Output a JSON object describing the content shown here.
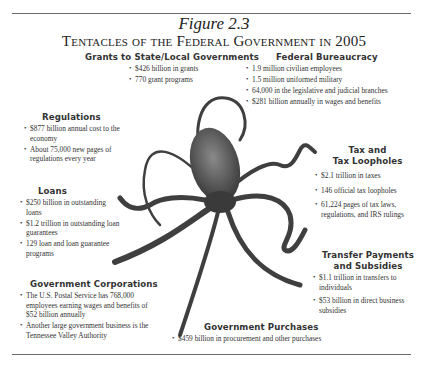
{
  "figure": {
    "number": "Figure 2.3",
    "title": "Tentacles of the Federal Government in 2005"
  },
  "illustration": {
    "subject": "octopus",
    "icon": "octopus-icon"
  },
  "sections": {
    "grants": {
      "heading": "Grants to State/Local Governments",
      "items": [
        "$426 billion in grants",
        "770 grant programs"
      ]
    },
    "bureaucracy": {
      "heading": "Federal Bureaucracy",
      "items": [
        "1.9 million civilian employees",
        "1.5 million uniformed military",
        "64,000 in the legislative and judicial branches",
        "$281 billion annually in wages and benefits"
      ]
    },
    "regulations": {
      "heading": "Regulations",
      "items": [
        "$877 billion annual cost to the economy",
        "About 75,000 new pages of regulations every year"
      ]
    },
    "tax": {
      "heading_line1": "Tax and",
      "heading_line2": "Tax Loopholes",
      "items": [
        "$2.1 trillion in taxes",
        "146 official tax loopholes",
        "61,224 pages of tax laws, regulations, and IRS rulings"
      ]
    },
    "loans": {
      "heading": "Loans",
      "items": [
        "$250 billion in outstanding loans",
        "$1.2 trillion in outstanding loan guarantees",
        "129 loan and loan guarantee programs"
      ]
    },
    "transfers": {
      "heading_line1": "Transfer Payments",
      "heading_line2": "and Subsidies",
      "items": [
        "$1.1 trillion in transfers to individuals",
        "$53 billion in direct business subsidies"
      ]
    },
    "corporations": {
      "heading": "Government Corporations",
      "items": [
        "The U.S. Postal Service has 768,000 employees earning wages and benefits of $52 billion annually",
        "Another large government business is the Tennessee Valley Authority"
      ]
    },
    "purchases": {
      "heading": "Government Purchases",
      "items": [
        "$459 billion in procurement and other purchases"
      ]
    }
  }
}
